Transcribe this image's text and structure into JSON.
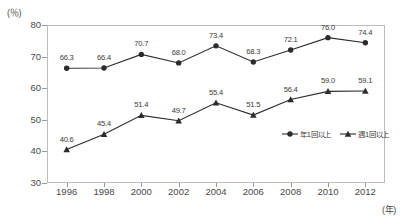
{
  "chart_data": {
    "type": "line",
    "title": "",
    "xlabel": "(年)",
    "ylabel": "(％)",
    "ylim": [
      30,
      80
    ],
    "yticks": [
      "30",
      "40",
      "50",
      "60",
      "70",
      "80"
    ],
    "grid": false,
    "legend_position": "inside-bottom-right",
    "categories": [
      "1996",
      "1998",
      "2000",
      "2002",
      "2004",
      "2006",
      "2008",
      "2010",
      "2012"
    ],
    "x": [
      1996,
      1998,
      2000,
      2002,
      2004,
      2006,
      2008,
      2010,
      2012
    ],
    "series": [
      {
        "name": "年1回以上",
        "marker": "circle",
        "color": "#2b2b2b",
        "values": [
          66.3,
          66.4,
          70.7,
          68.0,
          73.4,
          68.3,
          72.1,
          76.0,
          74.4
        ],
        "labels": [
          "66.3",
          "66.4",
          "70.7",
          "68.0",
          "73.4",
          "68.3",
          "72.1",
          "76.0",
          "74.4"
        ]
      },
      {
        "name": "週1回以上",
        "marker": "triangle",
        "color": "#2b2b2b",
        "values": [
          40.6,
          45.4,
          51.4,
          49.7,
          55.4,
          51.5,
          56.4,
          59.0,
          59.1
        ],
        "labels": [
          "40.6",
          "45.4",
          "51.4",
          "49.7",
          "55.4",
          "51.5",
          "56.4",
          "59.0",
          "59.1"
        ]
      }
    ]
  },
  "legend": {
    "items": [
      {
        "label": "年1回以上",
        "marker": "circle"
      },
      {
        "label": "週1回以上",
        "marker": "triangle"
      }
    ]
  }
}
